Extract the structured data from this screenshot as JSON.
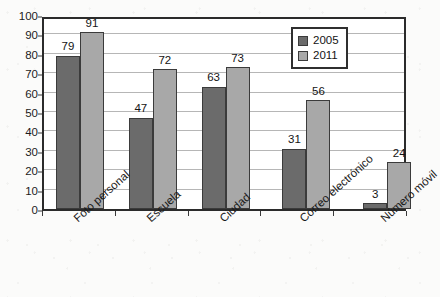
{
  "chart_data": {
    "type": "bar",
    "title": "",
    "subtitle": "",
    "xlabel": "",
    "ylabel": "",
    "ylim": [
      0,
      100
    ],
    "ytick_step": 10,
    "yticks": [
      100,
      90,
      80,
      70,
      60,
      50,
      40,
      30,
      20,
      10,
      0
    ],
    "grid": true,
    "grid_axis": "y",
    "legend_position": "top-right",
    "categories": [
      "Foto personal",
      "Escuela",
      "Ciudad",
      "Correo electrónico",
      "Número móvil"
    ],
    "series": [
      {
        "name": "2005",
        "color": "#6b6b6b",
        "values": [
          79,
          47,
          63,
          31,
          3
        ]
      },
      {
        "name": "2011",
        "color": "#a8a8a8",
        "values": [
          91,
          72,
          73,
          56,
          24
        ]
      }
    ],
    "data_labels": [
      [
        "79",
        "91"
      ],
      [
        "47",
        "72"
      ],
      [
        "63",
        "73"
      ],
      [
        "31",
        "56"
      ],
      [
        "3",
        "24"
      ]
    ]
  },
  "legend": {
    "entries": [
      {
        "label": "2005",
        "color": "#6b6b6b"
      },
      {
        "label": "2011",
        "color": "#a8a8a8"
      }
    ]
  },
  "colors": {
    "series_2005": "#6b6b6b",
    "series_2011": "#a8a8a8",
    "axis": "#2b2b2b",
    "gridline": "#b6b6b6",
    "plot_background": "#ffffff",
    "page_background": "#fbfbfa",
    "text": "#141414"
  }
}
